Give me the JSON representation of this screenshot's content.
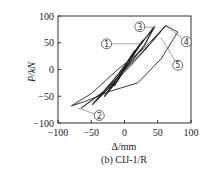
{
  "chart_data": {
    "type": "line",
    "title": "",
    "caption": "(b) CIJ-1/R",
    "xlabel": "Δ/mm",
    "ylabel": "P/kN",
    "xlim": [
      -100,
      100
    ],
    "ylim": [
      -100,
      100
    ],
    "xticks": [
      -100,
      -50,
      0,
      50,
      100
    ],
    "yticks": [
      -100,
      -50,
      0,
      50,
      100
    ],
    "grid": false,
    "series": [
      {
        "name": "cycle-1",
        "x": [
          -15,
          -5,
          5,
          15,
          5,
          -5,
          -15
        ],
        "y": [
          -30,
          -10,
          15,
          35,
          15,
          -10,
          -30
        ]
      },
      {
        "name": "cycle-2",
        "x": [
          -30,
          -10,
          10,
          28,
          10,
          -10,
          -30
        ],
        "y": [
          -50,
          -20,
          20,
          55,
          25,
          -15,
          -50
        ]
      },
      {
        "name": "cycle-3",
        "x": [
          -48,
          -20,
          10,
          30,
          45,
          20,
          -10,
          -48
        ],
        "y": [
          -65,
          -30,
          15,
          45,
          80,
          40,
          -10,
          -65
        ]
      },
      {
        "name": "cycle-4",
        "x": [
          -65,
          -35,
          0,
          30,
          62,
          40,
          5,
          -30,
          -65
        ],
        "y": [
          -72,
          -45,
          -5,
          35,
          82,
          50,
          5,
          -40,
          -72
        ]
      },
      {
        "name": "cycle-5",
        "x": [
          -80,
          -50,
          -10,
          30,
          62,
          80,
          55,
          20,
          -20,
          -60,
          -80
        ],
        "y": [
          -68,
          -45,
          0,
          40,
          82,
          70,
          20,
          -25,
          -40,
          -60,
          -68
        ]
      }
    ],
    "annotations": [
      {
        "label": "①",
        "x": -27,
        "y": 48,
        "points_to": [
          25,
          48
        ]
      },
      {
        "label": "②",
        "x": -38,
        "y": -86,
        "points_to": [
          -70,
          -72
        ]
      },
      {
        "label": "③",
        "x": 23,
        "y": 80,
        "points_to": [
          47,
          78
        ]
      },
      {
        "label": "④",
        "x": 93,
        "y": 52,
        "points_to": [
          62,
          82
        ]
      },
      {
        "label": "⑤",
        "x": 80,
        "y": 8,
        "points_to": [
          55,
          60
        ]
      }
    ]
  },
  "axes": {
    "xtick_labels": [
      "-100",
      "-50",
      "0",
      "50",
      "100"
    ],
    "ytick_labels": [
      "100",
      "50",
      "0",
      "-50",
      "-100"
    ]
  }
}
